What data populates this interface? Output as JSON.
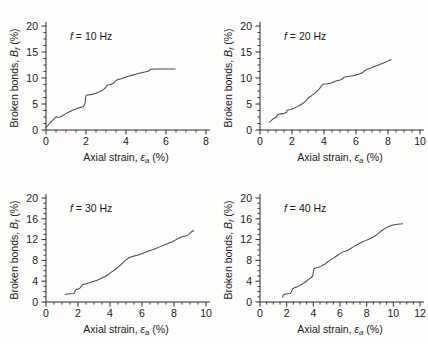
{
  "figure": {
    "layout": "2x2 grid of line plots",
    "background_color": "#fdfdfb",
    "curve_color": "#4a4a4a",
    "axis_color": "#2b2b2b"
  },
  "chart_data": [
    {
      "type": "line",
      "title": "f = 10 Hz",
      "frequency_hz": 10,
      "xlabel": "Axial strain, εa (%)",
      "ylabel": "Broken bonds, Bf (%)",
      "xlim": [
        0,
        8
      ],
      "ylim": [
        0,
        20
      ],
      "xticks": [
        0,
        2,
        4,
        6,
        8
      ],
      "yticks": [
        0,
        5,
        10,
        15,
        20
      ],
      "xminor_step": 0.5,
      "yminor_step": 1.25,
      "grid": false,
      "legend": "none",
      "x": [
        0.0,
        0.08,
        0.18,
        0.3,
        0.42,
        0.5,
        0.58,
        0.7,
        0.82,
        0.95,
        1.1,
        1.28,
        1.45,
        1.62,
        1.78,
        1.88,
        1.95,
        1.98,
        2.02,
        2.1,
        2.3,
        2.5,
        2.7,
        2.88,
        3.0,
        3.05,
        3.2,
        3.38,
        3.45,
        3.52,
        3.62,
        3.75,
        3.9,
        4.05,
        4.2,
        4.38,
        4.55,
        4.72,
        4.88,
        5.0,
        5.1,
        5.18,
        5.22,
        5.6,
        6.0,
        6.45
      ],
      "y": [
        0.5,
        0.8,
        1.3,
        1.75,
        2.2,
        2.55,
        2.45,
        2.5,
        2.75,
        3.05,
        3.35,
        3.7,
        4.0,
        4.25,
        4.4,
        4.55,
        5.1,
        6.3,
        6.7,
        6.75,
        6.85,
        7.05,
        7.4,
        7.8,
        8.2,
        8.6,
        8.75,
        8.95,
        9.4,
        9.55,
        9.7,
        9.85,
        10.05,
        10.25,
        10.45,
        10.6,
        10.8,
        10.95,
        11.1,
        11.2,
        11.3,
        11.45,
        11.7,
        11.72,
        11.73,
        11.75
      ]
    },
    {
      "type": "line",
      "title": "f = 20 Hz",
      "frequency_hz": 20,
      "xlabel": "Axial strain, εa (%)",
      "ylabel": "Broken bonds, Bf (%)",
      "xlim": [
        0,
        10
      ],
      "ylim": [
        0,
        20
      ],
      "xticks": [
        0,
        2,
        4,
        6,
        8,
        10
      ],
      "yticks": [
        0,
        5,
        10,
        15,
        20
      ],
      "xminor_step": 0.5,
      "yminor_step": 1.25,
      "grid": false,
      "legend": "none",
      "x": [
        0.6,
        0.7,
        0.8,
        0.95,
        1.05,
        1.1,
        1.3,
        1.5,
        1.65,
        1.7,
        1.9,
        2.1,
        2.3,
        2.5,
        2.7,
        2.85,
        2.95,
        3.05,
        3.2,
        3.35,
        3.5,
        3.62,
        3.72,
        3.8,
        3.88,
        3.95,
        4.05,
        4.2,
        4.4,
        4.6,
        4.8,
        5.0,
        5.15,
        5.25,
        5.4,
        5.6,
        5.8,
        6.0,
        6.2,
        6.4,
        6.55,
        6.7,
        6.85,
        7.0,
        7.2,
        7.4,
        7.6,
        7.8,
        7.95,
        8.1,
        8.2
      ],
      "y": [
        1.55,
        1.8,
        2.1,
        2.35,
        2.55,
        3.0,
        3.1,
        3.2,
        3.35,
        3.8,
        3.95,
        4.15,
        4.45,
        4.8,
        5.15,
        5.55,
        5.95,
        6.25,
        6.55,
        6.9,
        7.25,
        7.6,
        7.95,
        8.3,
        8.6,
        8.8,
        8.85,
        8.9,
        9.0,
        9.25,
        9.45,
        9.6,
        9.8,
        10.15,
        10.25,
        10.35,
        10.45,
        10.6,
        10.75,
        11.0,
        11.4,
        11.7,
        11.85,
        12.0,
        12.25,
        12.5,
        12.75,
        13.0,
        13.2,
        13.4,
        13.5
      ]
    },
    {
      "type": "line",
      "title": "f = 30 Hz",
      "frequency_hz": 30,
      "xlabel": "Axial strain, εa (%)",
      "ylabel": "Broken bonds, Bf (%)",
      "xlim": [
        0,
        10
      ],
      "ylim": [
        0,
        20
      ],
      "xticks": [
        0,
        2,
        4,
        6,
        8,
        10
      ],
      "yticks": [
        0,
        4,
        8,
        12,
        16,
        20
      ],
      "xminor_step": 0.5,
      "yminor_step": 1.0,
      "grid": false,
      "legend": "none",
      "x": [
        1.2,
        1.35,
        1.55,
        1.75,
        1.85,
        1.95,
        2.1,
        2.25,
        2.4,
        2.55,
        2.7,
        2.85,
        3.0,
        3.2,
        3.4,
        3.55,
        3.7,
        3.85,
        4.0,
        4.15,
        4.3,
        4.45,
        4.6,
        4.75,
        4.9,
        5.05,
        5.2,
        5.35,
        5.5,
        5.7,
        5.9,
        6.1,
        6.3,
        6.5,
        6.7,
        6.9,
        7.1,
        7.3,
        7.5,
        7.7,
        7.9,
        8.1,
        8.3,
        8.5,
        8.7,
        8.85,
        9.0,
        9.1,
        9.18,
        9.22
      ],
      "y": [
        1.5,
        1.55,
        1.6,
        1.65,
        2.3,
        2.45,
        2.6,
        3.25,
        3.4,
        3.55,
        3.7,
        3.85,
        4.0,
        4.2,
        4.45,
        4.7,
        4.9,
        5.2,
        5.55,
        5.9,
        6.2,
        6.55,
        6.95,
        7.4,
        7.85,
        8.2,
        8.55,
        8.7,
        8.85,
        9.0,
        9.2,
        9.4,
        9.65,
        9.9,
        10.1,
        10.35,
        10.6,
        10.85,
        11.1,
        11.35,
        11.6,
        11.95,
        12.25,
        12.55,
        12.7,
        12.85,
        13.2,
        13.55,
        13.7,
        13.6
      ]
    },
    {
      "type": "line",
      "title": "f = 40 Hz",
      "frequency_hz": 40,
      "xlabel": "Axial strain, εa (%)",
      "ylabel": "Broken bonds, Bf (%)",
      "xlim": [
        0,
        12
      ],
      "ylim": [
        0,
        20
      ],
      "xticks": [
        0,
        2,
        4,
        6,
        8,
        10,
        12
      ],
      "yticks": [
        0,
        4,
        8,
        12,
        16,
        20
      ],
      "xminor_step": 0.5,
      "yminor_step": 1.0,
      "grid": false,
      "legend": "none",
      "x": [
        1.7,
        1.75,
        1.85,
        1.95,
        2.1,
        2.3,
        2.45,
        2.55,
        2.65,
        2.8,
        3.0,
        3.2,
        3.4,
        3.55,
        3.7,
        3.85,
        3.95,
        4.05,
        4.15,
        4.25,
        4.4,
        4.55,
        4.7,
        4.85,
        5.0,
        5.2,
        5.4,
        5.6,
        5.8,
        6.0,
        6.2,
        6.4,
        6.6,
        6.8,
        7.0,
        7.2,
        7.45,
        7.7,
        7.95,
        8.2,
        8.45,
        8.7,
        8.95,
        9.2,
        9.45,
        9.7,
        9.9,
        10.1,
        10.3,
        10.5,
        10.7
      ],
      "y": [
        0.9,
        1.35,
        1.5,
        1.55,
        1.6,
        1.65,
        2.55,
        2.7,
        2.8,
        2.95,
        3.2,
        3.5,
        3.85,
        4.15,
        4.45,
        4.7,
        5.0,
        6.4,
        6.55,
        6.6,
        6.7,
        6.85,
        7.05,
        7.25,
        7.55,
        7.95,
        8.3,
        8.6,
        8.95,
        9.3,
        9.6,
        9.75,
        9.95,
        10.3,
        10.6,
        10.9,
        11.25,
        11.6,
        11.85,
        12.1,
        12.45,
        12.85,
        13.35,
        13.85,
        14.25,
        14.55,
        14.75,
        14.85,
        14.95,
        15.0,
        15.05
      ]
    }
  ]
}
